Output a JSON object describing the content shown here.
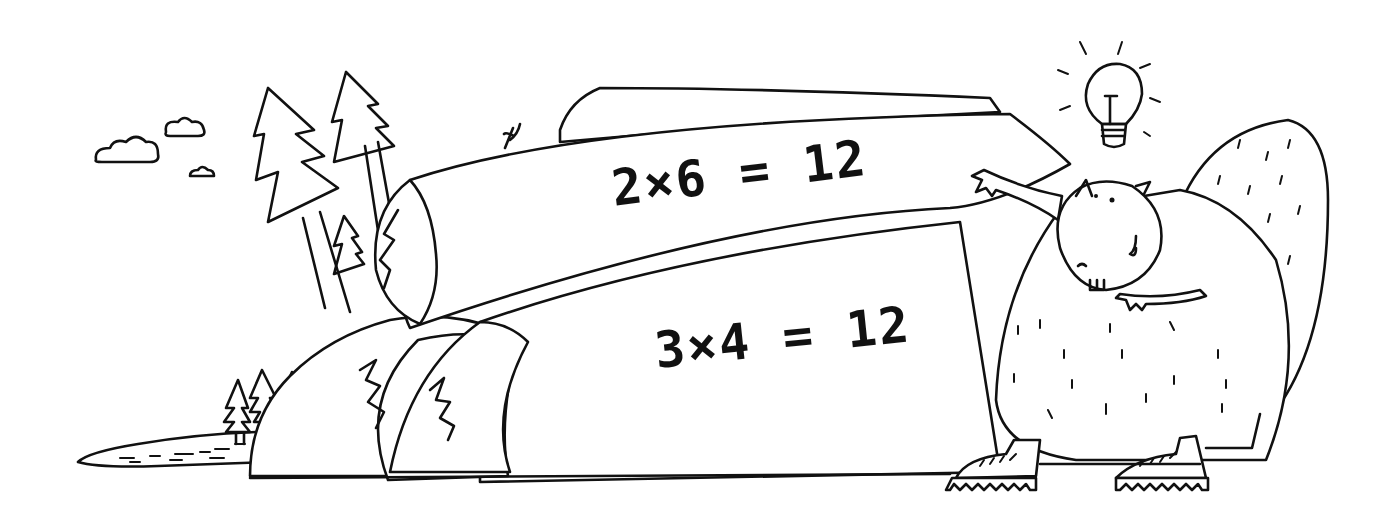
{
  "illustration": {
    "style": "black ink line drawing on white background",
    "colors": {
      "ink": "#111111",
      "background": "#ffffff"
    },
    "upper_log": {
      "equation": "2×6 = 12"
    },
    "lower_log": {
      "equation": "3×4 = 12"
    },
    "elements": [
      "clouds",
      "pine-trees",
      "lake",
      "hill",
      "stacked-logs",
      "beaver",
      "light-bulb",
      "boots"
    ]
  }
}
